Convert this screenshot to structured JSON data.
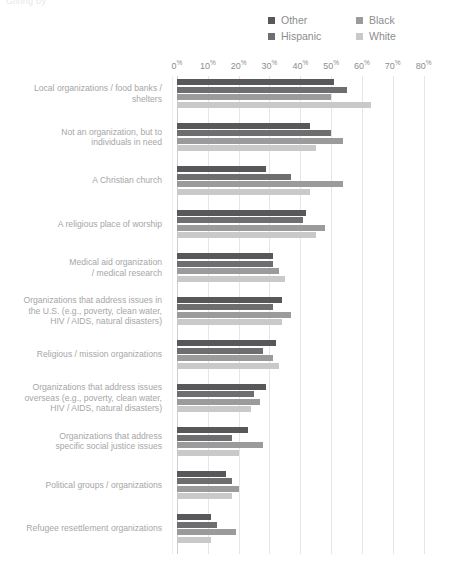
{
  "header": {
    "clipped_text": "Giving by"
  },
  "legend": {
    "position": "top-right",
    "items": [
      {
        "label": "Other",
        "color": "#58585a"
      },
      {
        "label": "Black",
        "color": "#9b9b9b"
      },
      {
        "label": "Hispanic",
        "color": "#6e6e70"
      },
      {
        "label": "White",
        "color": "#c9c9c9"
      }
    ]
  },
  "axis": {
    "ticks": [
      "0",
      "10",
      "20",
      "30",
      "40",
      "50",
      "60",
      "70",
      "80"
    ],
    "suffix": "%"
  },
  "chart_data": {
    "type": "bar",
    "orientation": "horizontal",
    "title": "",
    "subtitle": "",
    "xlabel": "",
    "ylabel": "",
    "xlim": [
      0,
      85
    ],
    "xticks": [
      0,
      10,
      20,
      30,
      40,
      50,
      60,
      70,
      80
    ],
    "grid": true,
    "legend_position": "top-right",
    "categories": [
      "Local organizations / food banks / shelters",
      "Not an organization, but to individuals in need",
      "A Christian church",
      "A religious place of worship",
      "Medical aid organization / medical research",
      "Organizations that address issues in the U.S. (e.g., poverty, clean water, HIV / AIDS, natural disasters)",
      "Religious / mission organizations",
      "Organizations that address issues overseas (e.g., poverty, clean water, HIV / AIDS, natural disasters)",
      "Organizations that address specific social justice issues",
      "Political groups / organizations",
      "Refugee resettlement organizations"
    ],
    "series": [
      {
        "name": "Other",
        "color": "#58585a",
        "values": [
          51,
          43,
          29,
          42,
          31,
          34,
          32,
          29,
          23,
          16,
          11
        ]
      },
      {
        "name": "Hispanic",
        "color": "#6e6e70",
        "values": [
          55,
          50,
          37,
          41,
          31,
          31,
          28,
          25,
          18,
          18,
          13
        ]
      },
      {
        "name": "Black",
        "color": "#9b9b9b",
        "values": [
          50,
          54,
          54,
          48,
          33,
          37,
          31,
          27,
          28,
          20,
          19
        ]
      },
      {
        "name": "White",
        "color": "#c9c9c9",
        "values": [
          63,
          45,
          43,
          45,
          35,
          34,
          33,
          24,
          20,
          18,
          11
        ]
      }
    ]
  },
  "category_label_lines": [
    [
      "Local organizations / food banks /",
      "shelters"
    ],
    [
      "Not an organization, but to",
      "individuals in need"
    ],
    [
      "A Christian church"
    ],
    [
      "A religious place of worship"
    ],
    [
      "Medical aid organization",
      "/ medical research"
    ],
    [
      "Organizations that address issues in",
      "the U.S. (e.g., poverty, clean water,",
      "HIV / AIDS, natural disasters)"
    ],
    [
      "Religious / mission organizations"
    ],
    [
      "Organizations that address issues",
      "overseas (e.g., poverty, clean water,",
      "HIV / AIDS, natural disasters)"
    ],
    [
      "Organizations that address",
      "specific social justice issues"
    ],
    [
      "Political groups / organizations"
    ],
    [
      "Refugee resettlement organizations"
    ]
  ]
}
